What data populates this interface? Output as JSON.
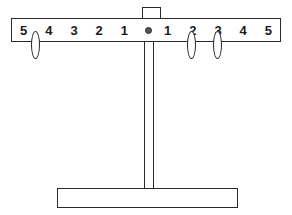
{
  "diagram": {
    "beam": {
      "left_labels": [
        "5",
        "4",
        "3",
        "2",
        "1"
      ],
      "center_label": "",
      "right_labels": [
        "1",
        "2",
        "3",
        "4",
        "5"
      ]
    },
    "pivot": {
      "name": "fulcrum",
      "marker": "dot"
    },
    "hanger": {
      "name": "top-loop"
    },
    "weights": [
      {
        "side": "left",
        "position": 5,
        "x": 31,
        "y": 31
      },
      {
        "side": "right",
        "position": 2,
        "x": 187,
        "y": 31
      },
      {
        "side": "right",
        "position": 3,
        "x": 213,
        "y": 31
      }
    ],
    "support": {
      "name": "vertical-post"
    },
    "base": {
      "name": "base-plate"
    },
    "colors": {
      "stroke": "#2a2a2a",
      "fill": "#ffffff",
      "text": "#1a1a1a"
    }
  }
}
